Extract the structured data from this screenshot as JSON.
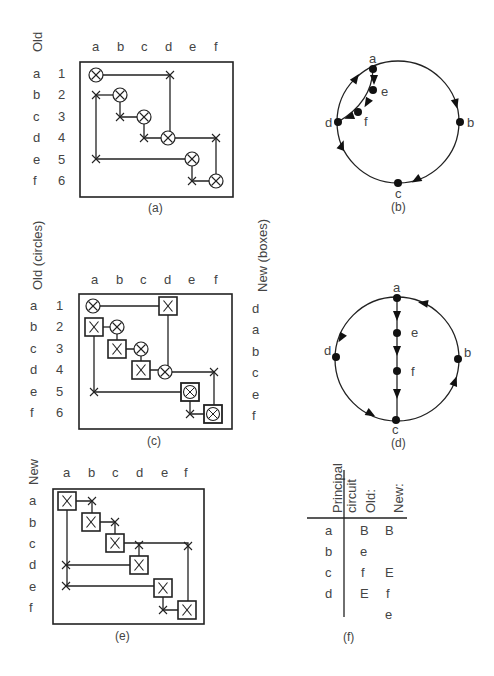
{
  "figure": {
    "panels": {
      "a": {
        "caption": "(a)",
        "row_axis_label": "Old",
        "column_labels": [
          "a",
          "b",
          "c",
          "d",
          "e",
          "f"
        ],
        "row_letters": [
          "a",
          "b",
          "c",
          "d",
          "e",
          "f"
        ],
        "row_numbers": [
          "1",
          "2",
          "3",
          "4",
          "5",
          "6"
        ],
        "circles": [
          [
            0,
            0
          ],
          [
            1,
            1
          ],
          [
            2,
            2
          ],
          [
            3,
            3
          ],
          [
            4,
            4
          ],
          [
            5,
            5
          ]
        ],
        "crosses": [
          [
            0,
            3
          ],
          [
            1,
            0
          ],
          [
            2,
            1
          ],
          [
            3,
            2
          ],
          [
            3,
            5
          ],
          [
            4,
            0
          ],
          [
            5,
            4
          ]
        ]
      },
      "b": {
        "caption": "(b)",
        "nodes": [
          "a",
          "b",
          "c",
          "d",
          "e",
          "f"
        ]
      },
      "c": {
        "caption": "(c)",
        "row_axis_label": "Old (circles)",
        "right_axis_label": "New (boxes)",
        "column_labels": [
          "a",
          "b",
          "c",
          "d",
          "e",
          "f"
        ],
        "row_letters": [
          "a",
          "b",
          "c",
          "d",
          "e",
          "f"
        ],
        "row_numbers": [
          "1",
          "2",
          "3",
          "4",
          "5",
          "6"
        ],
        "right_labels": [
          "d",
          "a",
          "b",
          "c",
          "e",
          "f"
        ]
      },
      "d": {
        "caption": "(d)",
        "nodes": [
          "a",
          "b",
          "c",
          "d",
          "e",
          "f"
        ]
      },
      "e": {
        "caption": "(e)",
        "row_axis_label": "New",
        "column_labels": [
          "a",
          "b",
          "c",
          "d",
          "e",
          "f"
        ],
        "row_letters": [
          "a",
          "b",
          "c",
          "d",
          "e",
          "f"
        ]
      },
      "f": {
        "caption": "(f)",
        "headers": [
          "Principal circuit",
          "Old:",
          "New:"
        ],
        "rows": [
          {
            "circuit": "a",
            "old": "B",
            "new": "B"
          },
          {
            "circuit": "b",
            "old": "e",
            "new": ""
          },
          {
            "circuit": "c",
            "old": "f",
            "new": "E"
          },
          {
            "circuit": "d",
            "old": "E",
            "new": "f"
          },
          {
            "circuit": "",
            "old": "",
            "new": "e"
          }
        ]
      }
    }
  }
}
